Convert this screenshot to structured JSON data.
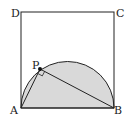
{
  "diagram": {
    "type": "geometry",
    "labels": {
      "A": "A",
      "B": "B",
      "C": "C",
      "D": "D",
      "P": "P"
    },
    "colors": {
      "stroke": "#222222",
      "fill": "#d9d9d9",
      "background": "#ffffff"
    },
    "elements": [
      {
        "name": "square",
        "vertices": [
          "A",
          "B",
          "C",
          "D"
        ]
      },
      {
        "name": "semicircle",
        "diameter": [
          "A",
          "B"
        ],
        "shaded": true
      },
      {
        "name": "segment",
        "from": "A",
        "to": "P"
      },
      {
        "name": "segment",
        "from": "P",
        "to": "B"
      },
      {
        "name": "right-angle-mark",
        "at": "P"
      },
      {
        "name": "point",
        "at": "P",
        "style": "filled-dot"
      }
    ]
  }
}
